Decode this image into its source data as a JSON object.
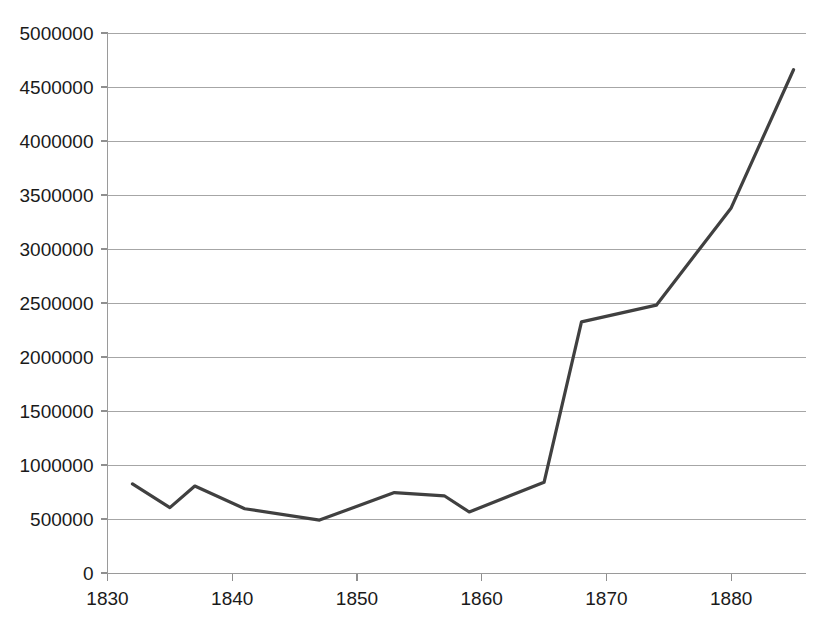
{
  "chart_data": {
    "type": "line",
    "title": "",
    "subtitle": "",
    "xlabel": "",
    "ylabel": "",
    "xlim": [
      1830,
      1886
    ],
    "ylim": [
      0,
      5000000
    ],
    "grid": true,
    "legend": false,
    "legend_position": "none",
    "line_color": "#404040",
    "x": [
      1832,
      1835,
      1837,
      1841,
      1847,
      1853,
      1857,
      1859,
      1865,
      1868,
      1874,
      1880,
      1885
    ],
    "values": [
      825000,
      605000,
      805000,
      595000,
      490000,
      745000,
      715000,
      565000,
      840000,
      2325000,
      2480000,
      3380000,
      4660000
    ],
    "series": [
      {
        "name": "series-1",
        "x": [
          1832,
          1835,
          1837,
          1841,
          1847,
          1853,
          1857,
          1859,
          1865,
          1868,
          1874,
          1880,
          1885
        ],
        "values": [
          825000,
          605000,
          805000,
          595000,
          490000,
          745000,
          715000,
          565000,
          840000,
          2325000,
          2480000,
          3380000,
          4660000
        ]
      }
    ],
    "yticks": [
      0,
      500000,
      1000000,
      1500000,
      2000000,
      2500000,
      3000000,
      3500000,
      4000000,
      4500000,
      5000000
    ],
    "ytick_labels": [
      "0",
      "500000",
      "1000000",
      "1500000",
      "2000000",
      "2500000",
      "3000000",
      "3500000",
      "4000000",
      "4500000",
      "5000000"
    ],
    "xticks": [
      1830,
      1840,
      1850,
      1860,
      1870,
      1880
    ],
    "xtick_labels": [
      "1830",
      "1840",
      "1850",
      "1860",
      "1870",
      "1880"
    ]
  }
}
